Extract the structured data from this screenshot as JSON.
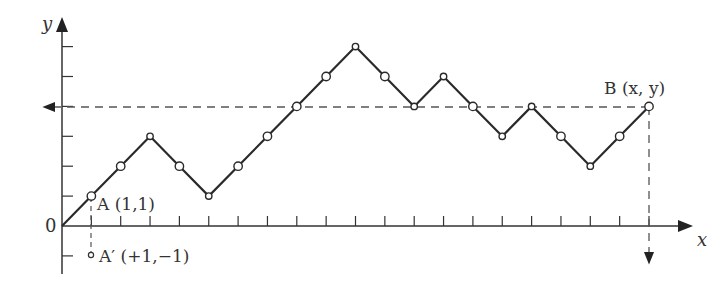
{
  "diagram": {
    "type": "lattice path / random walk",
    "axes": {
      "x_label": "x",
      "y_label": "y",
      "origin_label": "0"
    },
    "points": {
      "A": {
        "label": "A (1,1)",
        "x": 1,
        "y": 1
      },
      "A_prime": {
        "label": "A′ (+1,−1)",
        "x": 1,
        "y": -1
      },
      "B": {
        "label": "B (x, y)",
        "x": 20,
        "y": 4
      }
    },
    "path": [
      [
        0,
        0
      ],
      [
        1,
        1
      ],
      [
        2,
        2
      ],
      [
        3,
        3
      ],
      [
        4,
        2
      ],
      [
        5,
        1
      ],
      [
        6,
        2
      ],
      [
        7,
        3
      ],
      [
        8,
        4
      ],
      [
        9,
        5
      ],
      [
        10,
        6
      ],
      [
        11,
        5
      ],
      [
        12,
        4
      ],
      [
        13,
        5
      ],
      [
        14,
        4
      ],
      [
        15,
        3
      ],
      [
        16,
        4
      ],
      [
        17,
        3
      ],
      [
        18,
        2
      ],
      [
        19,
        3
      ],
      [
        20,
        4
      ]
    ],
    "colors": {
      "line": "#2a2a2a",
      "dashed": "#555555",
      "text": "#333333"
    }
  }
}
